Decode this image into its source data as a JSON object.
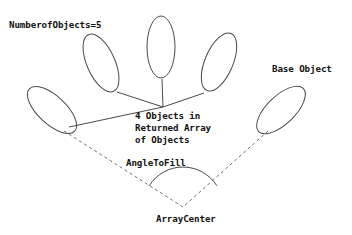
{
  "diagram": {
    "background_color": "#ffffff",
    "stroke_color": "#4a4a4a",
    "text_color": "#111111",
    "labels": {
      "number_of_objects": "NumberofObjects=5",
      "base_object": "Base Object",
      "returned_array_line1": "4 Objects in",
      "returned_array_line2": "Returned Array",
      "returned_array_line3": "of Objects",
      "angle_to_fill": "AngleToFill",
      "array_center": "ArrayCenter"
    },
    "objects": [
      {
        "name": "object-1",
        "cx": 52,
        "cy": 110,
        "rx": 14,
        "ry": 31,
        "rotation": -47
      },
      {
        "name": "object-2",
        "cx": 101,
        "cy": 63,
        "rx": 14,
        "ry": 31,
        "rotation": -24
      },
      {
        "name": "object-3",
        "cx": 161,
        "cy": 47,
        "rx": 14,
        "ry": 31,
        "rotation": 0
      },
      {
        "name": "object-4",
        "cx": 219,
        "cy": 62,
        "rx": 14,
        "ry": 31,
        "rotation": 23
      },
      {
        "name": "object-5",
        "cx": 281,
        "cy": 110,
        "rx": 14,
        "ry": 31,
        "rotation": 46
      }
    ],
    "connector_lines": [
      {
        "name": "connector-object-1",
        "x1": 69,
        "y1": 127,
        "x2": 163,
        "y2": 107
      },
      {
        "name": "connector-object-2",
        "x1": 117,
        "y1": 92,
        "x2": 163,
        "y2": 107
      },
      {
        "name": "connector-object-3",
        "x1": 162,
        "y1": 79,
        "x2": 163,
        "y2": 107
      },
      {
        "name": "connector-object-4",
        "x1": 204,
        "y1": 93,
        "x2": 163,
        "y2": 107
      }
    ],
    "radius_lines": [
      {
        "name": "radius-left",
        "x1": 64,
        "y1": 131,
        "x2": 183,
        "y2": 207,
        "dashed": true
      },
      {
        "name": "radius-right",
        "x1": 268,
        "y1": 131,
        "x2": 183,
        "y2": 207,
        "dashed": true
      }
    ],
    "angle_arc": {
      "name": "angle-to-fill-arc",
      "center_x": 183,
      "center_y": 207,
      "radius": 40,
      "start_angle_deg": 212,
      "end_angle_deg": 328
    },
    "array_center_point": {
      "x": 183,
      "y": 207
    }
  }
}
